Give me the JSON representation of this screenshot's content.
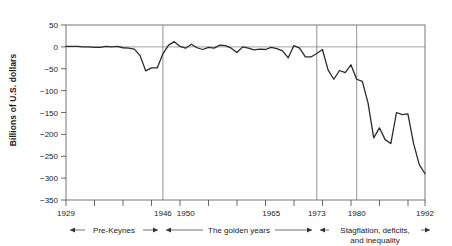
{
  "chart_data": {
    "type": "line",
    "title": "",
    "xlabel": "",
    "ylabel": "Billions of U.S. dollars",
    "xlim": [
      1929,
      1992
    ],
    "ylim": [
      -350,
      50
    ],
    "grid": "vertical-era-separators-and-zero-line",
    "legend": "none",
    "ytick_labels": [
      "50",
      "0",
      "−50",
      "−100",
      "−150",
      "−200",
      "−250",
      "−300",
      "−350"
    ],
    "ytick_values": [
      50,
      0,
      -50,
      -100,
      -150,
      -200,
      -250,
      -300,
      -350
    ],
    "xtick_labels": [
      "1929",
      "1946",
      "1950",
      "1965",
      "1973",
      "1980",
      "1992"
    ],
    "xtick_values": [
      1929,
      1946,
      1950,
      1965,
      1973,
      1980,
      1992
    ],
    "era_separators": [
      1946,
      1973,
      1980
    ],
    "x": [
      1929,
      1930,
      1931,
      1932,
      1933,
      1934,
      1935,
      1936,
      1937,
      1938,
      1939,
      1940,
      1941,
      1942,
      1943,
      1944,
      1945,
      1946,
      1947,
      1948,
      1949,
      1950,
      1951,
      1952,
      1953,
      1954,
      1955,
      1956,
      1957,
      1958,
      1959,
      1960,
      1961,
      1962,
      1963,
      1964,
      1965,
      1966,
      1967,
      1968,
      1969,
      1970,
      1971,
      1972,
      1973,
      1974,
      1975,
      1976,
      1977,
      1978,
      1979,
      1980,
      1981,
      1982,
      1983,
      1984,
      1985,
      1986,
      1987,
      1988,
      1989,
      1990,
      1991,
      1992
    ],
    "values": [
      1,
      1,
      1,
      0,
      0,
      -1,
      -1,
      1,
      0,
      1,
      -2,
      -3,
      -5,
      -20,
      -55,
      -48,
      -48,
      -16,
      4,
      12,
      1,
      -3,
      6,
      -2,
      -6,
      -1,
      -3,
      4,
      3,
      -3,
      -13,
      0,
      -3,
      -7,
      -5,
      -6,
      -1,
      -4,
      -9,
      -25,
      3,
      -3,
      -23,
      -23,
      -15,
      -6,
      -53,
      -74,
      -54,
      -59,
      -41,
      -74,
      -79,
      -128,
      -208,
      -185,
      -212,
      -221,
      -150,
      -155,
      -153,
      -221,
      -269,
      -290
    ],
    "series_name": "Federal budget surplus/deficit",
    "annotations": [
      {
        "label": "Pre-Keynes",
        "from": 1929,
        "to": 1946,
        "style": "double-arrow"
      },
      {
        "label": "The golden years",
        "from": 1946,
        "to": 1973,
        "style": "double-arrow"
      },
      {
        "label": "Stagflation, deficits,",
        "label2": "and inequality",
        "from": 1973,
        "to": 1992,
        "style": "double-arrow"
      }
    ]
  },
  "axis": {
    "ylabel": "Billions of U.S. dollars"
  },
  "annotations": {
    "era1": "Pre-Keynes",
    "era2": "The golden years",
    "era3_line1": "Stagflation, deficits,",
    "era3_line2": "and inequality"
  },
  "ticks": {
    "y": [
      "50",
      "0",
      "−50",
      "−100",
      "−150",
      "−200",
      "−250",
      "−300",
      "−350"
    ],
    "x": [
      "1929",
      "1946",
      "1950",
      "1965",
      "1973",
      "1980",
      "1992"
    ]
  },
  "colors": {
    "series": "#2b2b2b",
    "grid": "#777777",
    "frame": "#555555",
    "background": "#ffffff",
    "text": "#1a1a1a"
  }
}
